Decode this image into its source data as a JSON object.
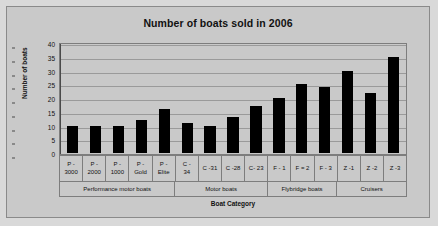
{
  "chart_data": {
    "type": "bar",
    "title": "Number of boats sold in 2006",
    "xlabel": "Boat Category",
    "ylabel": "Number of boats",
    "ylim": [
      0,
      40
    ],
    "ytick_step": 5,
    "yticks": [
      "40",
      "35",
      "30",
      "25",
      "20",
      "15",
      "10",
      "5",
      "0"
    ],
    "grid": true,
    "legend": "none",
    "categories": [
      "P - 3000",
      "P - 2000",
      "P - 1000",
      "P - Gold",
      "P - Elite",
      "C - 34",
      "C - 31",
      "C - 28",
      "C - 23",
      "F - 1",
      "F - 2",
      "F - 3",
      "Z - 1",
      "Z - 2",
      "Z - 3"
    ],
    "category_lines": [
      [
        "P -",
        "3000"
      ],
      [
        "P -",
        "2000"
      ],
      [
        "P -",
        "1000"
      ],
      [
        "P -",
        "Gold"
      ],
      [
        "P -",
        "Elite"
      ],
      [
        "C -",
        "34"
      ],
      [
        "C -31",
        ""
      ],
      [
        "C -28",
        ""
      ],
      [
        "C- 23",
        ""
      ],
      [
        "F - 1",
        ""
      ],
      [
        "F = 2",
        ""
      ],
      [
        "F - 3",
        ""
      ],
      [
        "Z -1",
        ""
      ],
      [
        "Z -2",
        ""
      ],
      [
        "Z -3",
        ""
      ]
    ],
    "values": [
      10,
      10,
      10,
      12,
      16,
      11,
      10,
      13,
      17,
      20,
      25,
      24,
      30,
      22,
      35
    ],
    "groups": [
      {
        "label": "Performance motor boats",
        "span": 5
      },
      {
        "label": "Motor boats",
        "span": 4
      },
      {
        "label": "Flybridge boats",
        "span": 3
      },
      {
        "label": "Cruisers",
        "span": 3
      }
    ],
    "bar_color": "#000000",
    "plot_background": "#c9c9c9",
    "grid_color": "#9a9a9a"
  }
}
